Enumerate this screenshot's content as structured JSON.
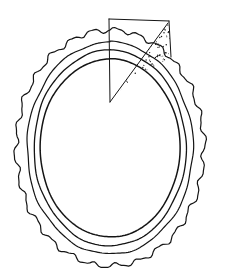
{
  "figure": {
    "title": "Concentric ring cross-section with shaded sector",
    "background_color": "#ffffff",
    "stroke_color": "#141414",
    "stipple_color": "#1a1a1a",
    "canvas": {
      "width": 238,
      "height": 275
    },
    "center": {
      "x": 110,
      "y": 148
    },
    "contours": [
      {
        "name": "outer-scalloped-contour",
        "label": "Outer boundary",
        "style": "scalloped",
        "radius_x": 94,
        "radius_y": 118,
        "stroke_width": 1.2,
        "wave_amplitude": 2.2,
        "wave_count": 26
      },
      {
        "name": "second-contour",
        "label": "Second ring",
        "style": "smooth",
        "radius_x": 83,
        "radius_y": 106,
        "stroke_width": 1.2,
        "wave_amplitude": 0.7,
        "wave_count": 9
      },
      {
        "name": "third-contour",
        "label": "Third ring",
        "style": "smooth",
        "radius_x": 76,
        "radius_y": 98,
        "stroke_width": 1.3,
        "wave_amplitude": 0.5,
        "wave_count": 7
      },
      {
        "name": "inner-contour",
        "label": "Inner circle",
        "style": "smooth",
        "radius_x": 70,
        "radius_y": 89,
        "stroke_width": 1.5,
        "wave_amplitude": 0.3,
        "wave_count": 5
      }
    ],
    "sector": {
      "name": "sector-overlay",
      "label": "Sector wedge overlay",
      "apex": {
        "x": 110,
        "y": 102
      },
      "left_edge_top": {
        "x": 109,
        "y": 19
      },
      "top_edge_right": {
        "x": 169,
        "y": 21
      },
      "right_edge_bottom": {
        "x": 171,
        "y": 57
      },
      "radius_line_top": {
        "x": 168,
        "y": 23
      },
      "stipple_dot_count": 330,
      "stipple_dot_radius": 0.55
    }
  }
}
